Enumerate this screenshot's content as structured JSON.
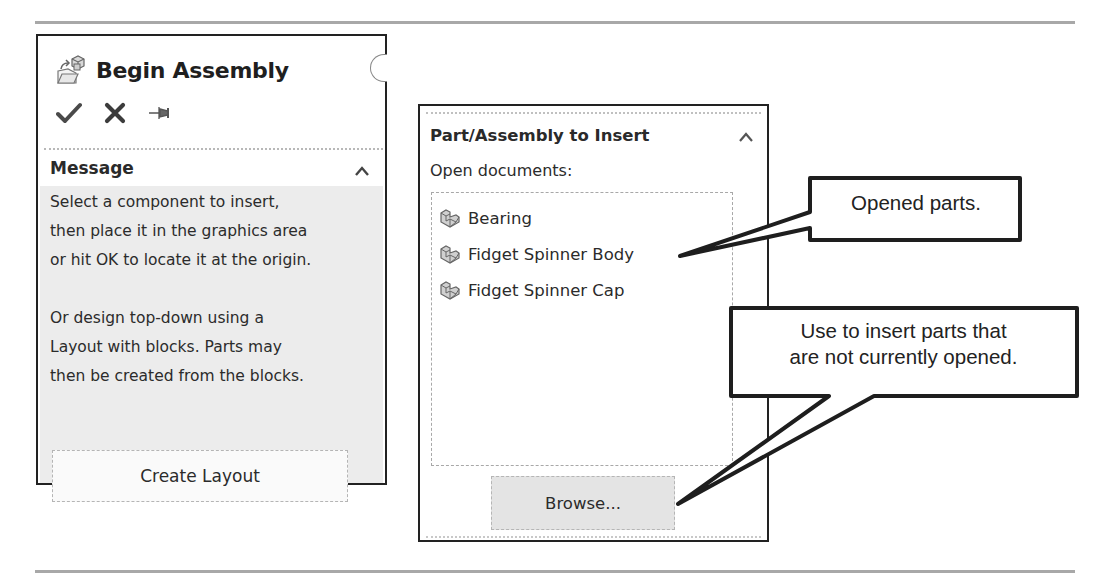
{
  "left_panel": {
    "title": "Begin Assembly",
    "title_icon": "begin-assembly-icon",
    "actions": [
      {
        "name": "ok",
        "icon": "checkmark-icon",
        "glyph": "✔"
      },
      {
        "name": "cancel",
        "icon": "close-icon",
        "glyph": "✖"
      },
      {
        "name": "pin",
        "icon": "pushpin-icon",
        "glyph": "⇥"
      }
    ],
    "message_section": {
      "title": "Message",
      "collapse_icon": "chevron-up-icon",
      "text": "Select a component to insert,\nthen place it in the graphics area\nor hit OK to locate it at the origin.\n\nOr design top-down using a\nLayout with blocks. Parts may\nthen be created from the blocks.",
      "button_label": "Create Layout"
    }
  },
  "right_panel": {
    "section_title": "Part/Assembly to Insert",
    "collapse_icon": "chevron-up-icon",
    "open_docs_label": "Open documents:",
    "documents": [
      {
        "name": "Bearing",
        "icon": "part-icon"
      },
      {
        "name": "Fidget Spinner Body",
        "icon": "part-icon"
      },
      {
        "name": "Fidget Spinner Cap",
        "icon": "part-icon"
      }
    ],
    "browse_label": "Browse..."
  },
  "callouts": {
    "opened_parts": "Opened parts.",
    "browse_hint": "Use to insert parts that\nare not currently opened."
  },
  "colors": {
    "panel_border": "#222222",
    "message_bg": "#ececec",
    "browse_bg": "#e4e4e4",
    "rule": "#a8a8a8",
    "icon_gray": "#555555"
  }
}
